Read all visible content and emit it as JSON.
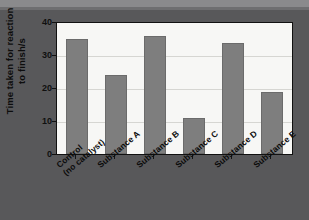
{
  "chart_data": {
    "type": "bar",
    "title": "",
    "xlabel": "",
    "ylabel": "Time taken for reaction to finish/s",
    "ylabel_line1": "Time taken for reaction",
    "ylabel_line2": "to finish/s",
    "categories": [
      "Control (no catalyst)",
      "Substance A",
      "Substance B",
      "Substance C",
      "Substance D",
      "Substance E"
    ],
    "category_lines": [
      [
        "Control",
        "(no catalyst)"
      ],
      [
        "Substance A",
        ""
      ],
      [
        "Substance B",
        ""
      ],
      [
        "Substance C",
        ""
      ],
      [
        "Substance D",
        ""
      ],
      [
        "Substance E",
        ""
      ]
    ],
    "values": [
      35,
      24,
      36,
      11,
      34,
      19
    ],
    "ylim": [
      0,
      40
    ],
    "yticks": [
      0,
      10,
      20,
      30,
      40
    ],
    "ytick_labels": [
      "0",
      "10",
      "20",
      "30",
      "40"
    ],
    "grid": true,
    "grid_axis": "y",
    "legend": "none",
    "colors": {
      "bar_fill": "#7e7e7e",
      "bar_edge": "#6b6b6b",
      "plot_background": "#f7f7f5",
      "figure_background": "#58585a",
      "gridline": "#d6d6d2",
      "axis": "#111111",
      "text": "#0d0d0d"
    }
  }
}
